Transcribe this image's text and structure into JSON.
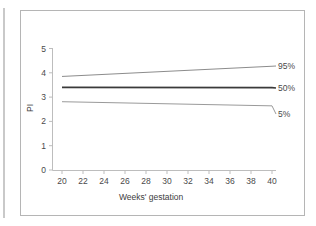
{
  "figure": {
    "background_color": "#ffffff",
    "border_color": "#b5b5b5"
  },
  "chart_data": {
    "type": "line",
    "title": "",
    "xlabel": "Weeks' gestation",
    "ylabel": "PI",
    "x": [
      20,
      40
    ],
    "xlim": [
      19,
      41
    ],
    "ylim": [
      0,
      5
    ],
    "xticks": [
      "20",
      "22",
      "24",
      "26",
      "28",
      "30",
      "32",
      "34",
      "36",
      "38",
      "40"
    ],
    "yticks": [
      "0",
      "1",
      "2",
      "3",
      "4",
      "5"
    ],
    "grid": false,
    "legend_position": "right-inline",
    "series": [
      {
        "name": "95%",
        "label": "95%",
        "values": [
          3.85,
          4.27
        ],
        "color": "#8c8c8c",
        "width": 1.0
      },
      {
        "name": "50%",
        "label": "50%",
        "values": [
          3.4,
          3.39
        ],
        "color": "#3a3a3a",
        "width": 1.6
      },
      {
        "name": "5%",
        "label": "5%",
        "values": [
          2.81,
          2.64
        ],
        "color": "#9a9a9a",
        "width": 1.0
      }
    ]
  }
}
